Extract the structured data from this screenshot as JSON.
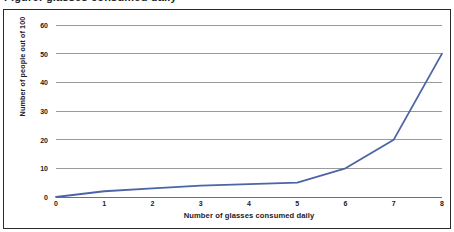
{
  "caption": {
    "text": "Figure: glasses consumed daily"
  },
  "chart_data": {
    "type": "line",
    "title": "",
    "xlabel": "Number of glasses consumed daily",
    "ylabel": "Number of people out of 100",
    "x": [
      0,
      1,
      2,
      3,
      4,
      5,
      6,
      7,
      8
    ],
    "values": [
      0,
      2,
      3,
      4,
      4.5,
      5,
      10,
      20,
      50
    ],
    "series": [
      {
        "name": "Number of people out of 100",
        "values": [
          0,
          2,
          3,
          4,
          4.5,
          5,
          10,
          20,
          50
        ],
        "color": "#4c64a8"
      }
    ],
    "xlim": [
      0,
      8
    ],
    "ylim": [
      0,
      60
    ],
    "xticks": [
      "0",
      "1",
      "2",
      "3",
      "4",
      "5",
      "6",
      "7",
      "8"
    ],
    "yticks": [
      "0",
      "10",
      "20",
      "30",
      "40",
      "50",
      "60"
    ],
    "grid": "horizontal",
    "legend": "none",
    "gridline_color": "#9a9a9a",
    "axis_color": "#6f6f6f",
    "border_color": "#2b2b2b"
  }
}
